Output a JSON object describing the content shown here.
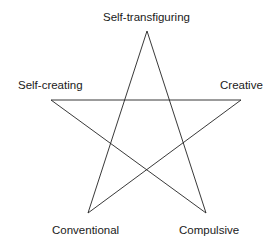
{
  "diagram": {
    "type": "pentagram",
    "stroke_color": "#222222",
    "vertices": [
      {
        "id": "top",
        "label": "Self-transfiguring"
      },
      {
        "id": "left",
        "label": "Self-creating"
      },
      {
        "id": "right",
        "label": "Creative"
      },
      {
        "id": "bottom-left",
        "label": "Conventional"
      },
      {
        "id": "bottom-right",
        "label": "Compulsive"
      }
    ],
    "edges": [
      [
        "top",
        "bottom-left"
      ],
      [
        "top",
        "bottom-right"
      ],
      [
        "left",
        "right"
      ],
      [
        "left",
        "bottom-right"
      ],
      [
        "right",
        "bottom-left"
      ]
    ]
  }
}
